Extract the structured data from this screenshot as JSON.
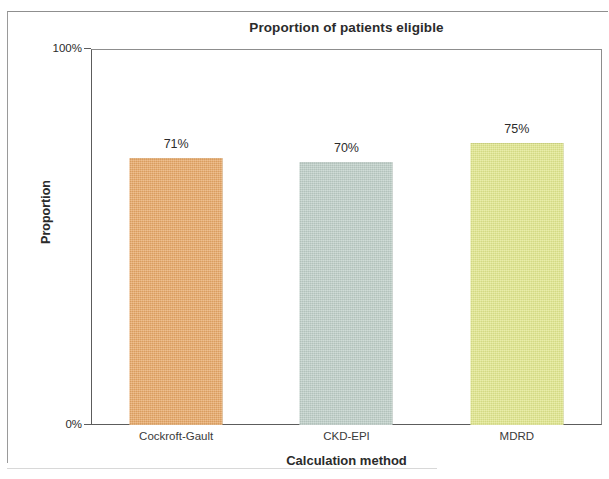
{
  "figure": {
    "title": "Proportion of patients eligible",
    "x_axis_title": "Calculation method",
    "y_axis_title": "Proportion",
    "y_tick_top": "100%",
    "y_tick_bottom": "0%"
  },
  "chart_data": {
    "type": "bar",
    "title": "Proportion of patients eligible",
    "xlabel": "Calculation method",
    "ylabel": "Proportion",
    "categories": [
      "Cockroft-Gault",
      "CKD-EPI",
      "MDRD"
    ],
    "values": [
      71,
      70,
      75
    ],
    "value_labels": [
      "71%",
      "70%",
      "75%"
    ],
    "tick_labels": [
      "0%",
      "100%"
    ],
    "ylim": [
      0,
      100
    ],
    "grid": false,
    "legend": null,
    "colors": [
      "#e8a866",
      "#bfcfc8",
      "#e2e88d"
    ],
    "units": "percent"
  }
}
